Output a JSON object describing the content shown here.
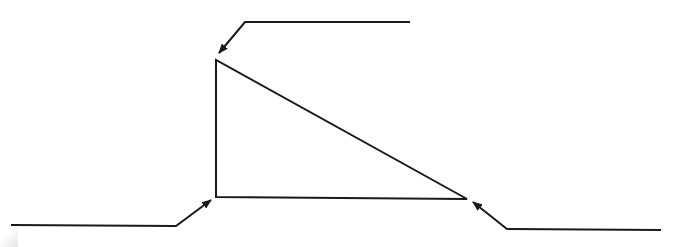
{
  "diagram": {
    "type": "right-triangle-with-leader-arrows",
    "canvas": {
      "width": 694,
      "height": 247,
      "background": "#ffffff"
    },
    "stroke_color": "#1a1a1a",
    "stroke_width": 2,
    "triangle": {
      "vertices": {
        "top": [
          216,
          60
        ],
        "bottom_left": [
          216,
          197
        ],
        "bottom_right": [
          467,
          199
        ]
      }
    },
    "leaders": [
      {
        "name": "top-vertex-leader",
        "points": [
          [
            410,
            22
          ],
          [
            245,
            22
          ],
          [
            219,
            53
          ]
        ],
        "label": ""
      },
      {
        "name": "bottom-left-vertex-leader",
        "points": [
          [
            11,
            225
          ],
          [
            176,
            226
          ],
          [
            211,
            200
          ]
        ],
        "label": ""
      },
      {
        "name": "bottom-right-vertex-leader",
        "points": [
          [
            661,
            230
          ],
          [
            507,
            229
          ],
          [
            473,
            202
          ]
        ],
        "label": ""
      }
    ]
  }
}
